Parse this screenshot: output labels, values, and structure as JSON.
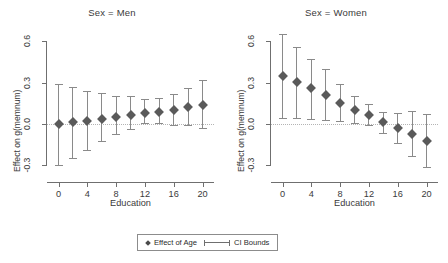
{
  "figure": {
    "ylabel": "Effect on g(memnum)",
    "xlabel": "Education",
    "legend": {
      "point_label": "Effect of Age",
      "ci_label": "CI Bounds"
    }
  },
  "chart_data": [
    {
      "type": "scatter",
      "title": "Sex = Men",
      "xlabel": "Education",
      "ylabel": "Effect on g(memnum)",
      "xlim": [
        -1.6,
        21.6
      ],
      "ylim": [
        -0.42,
        0.68
      ],
      "xticks": [
        0,
        4,
        8,
        12,
        16,
        20
      ],
      "yticks": [
        -0.3,
        0.0,
        0.3,
        0.6
      ],
      "ytick_labels": [
        "-0.3",
        "0.0",
        "0.3",
        "0.6"
      ],
      "grid": false,
      "zero_reference_line": 0.0,
      "x": [
        0,
        2,
        4,
        6,
        8,
        10,
        12,
        14,
        16,
        18,
        20
      ],
      "values": [
        0.0,
        0.012,
        0.025,
        0.038,
        0.052,
        0.068,
        0.078,
        0.088,
        0.103,
        0.12,
        0.138
      ],
      "ci_lower": [
        -0.295,
        -0.248,
        -0.19,
        -0.12,
        -0.075,
        -0.035,
        0.005,
        0.005,
        -0.01,
        -0.008,
        -0.03
      ],
      "ci_upper": [
        0.292,
        0.268,
        0.24,
        0.222,
        0.205,
        0.2,
        0.178,
        0.185,
        0.215,
        0.262,
        0.32
      ]
    },
    {
      "type": "scatter",
      "title": "Sex = Women",
      "xlabel": "Education",
      "ylabel": "Effect on g(memnum)",
      "xlim": [
        -1.6,
        21.6
      ],
      "ylim": [
        -0.42,
        0.68
      ],
      "xticks": [
        0,
        4,
        8,
        12,
        16,
        20
      ],
      "yticks": [
        -0.3,
        0.0,
        0.3,
        0.6
      ],
      "ytick_labels": [
        "-0.3",
        "0.0",
        "0.3",
        "0.6"
      ],
      "grid": false,
      "zero_reference_line": 0.0,
      "x": [
        0,
        2,
        4,
        6,
        8,
        10,
        12,
        14,
        16,
        18,
        20
      ],
      "values": [
        0.348,
        0.307,
        0.262,
        0.212,
        0.155,
        0.105,
        0.068,
        0.012,
        -0.03,
        -0.072,
        -0.122
      ],
      "ci_lower": [
        0.046,
        0.042,
        0.035,
        0.03,
        0.022,
        0.01,
        -0.005,
        -0.065,
        -0.14,
        -0.235,
        -0.312
      ],
      "ci_upper": [
        0.65,
        0.56,
        0.47,
        0.395,
        0.288,
        0.2,
        0.142,
        0.09,
        0.08,
        0.092,
        0.07
      ]
    }
  ]
}
